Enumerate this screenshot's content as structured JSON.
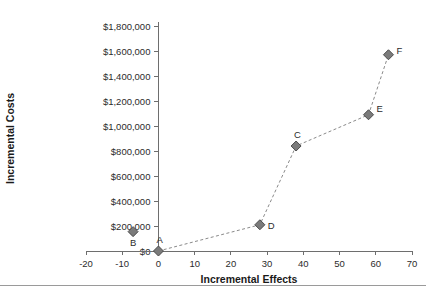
{
  "chart_data": {
    "type": "scatter",
    "title": "",
    "xlabel": "Incremental Effects",
    "ylabel": "Incremental Costs",
    "xlim": [
      -20,
      70
    ],
    "ylim": [
      0,
      1800000
    ],
    "grid": false,
    "legend": "none",
    "xticks": [
      "-20",
      "-10",
      "0",
      "10",
      "20",
      "30",
      "40",
      "50",
      "60",
      "70"
    ],
    "xtick_values": [
      -20,
      -10,
      0,
      10,
      20,
      30,
      40,
      50,
      60,
      70
    ],
    "yticks": [
      "$0",
      "$200,000",
      "$400,000",
      "$600,000",
      "$800,000",
      "$1,000,000",
      "$1,200,000",
      "$1,400,000",
      "$1,600,000",
      "$1,800,000"
    ],
    "ytick_values": [
      0,
      200000,
      400000,
      600000,
      800000,
      1000000,
      1200000,
      1400000,
      1600000,
      1800000
    ],
    "points": [
      {
        "label": "A",
        "x": 0,
        "y": 0,
        "label_dx": -2,
        "label_dy": -8
      },
      {
        "label": "B",
        "x": -7,
        "y": 155000,
        "label_dx": -3,
        "label_dy": 14
      },
      {
        "label": "C",
        "x": 38,
        "y": 840000,
        "label_dx": -2,
        "label_dy": -8
      },
      {
        "label": "D",
        "x": 28,
        "y": 210000,
        "label_dx": 8,
        "label_dy": 4
      },
      {
        "label": "E",
        "x": 58,
        "y": 1090000,
        "label_dx": 8,
        "label_dy": -3
      },
      {
        "label": "F",
        "x": 63.5,
        "y": 1570000,
        "label_dx": 8,
        "label_dy": -1
      }
    ],
    "frontier_path": [
      "A",
      "D",
      "C",
      "E",
      "F"
    ],
    "colors": {
      "marker_fill": "#7b7b7b",
      "marker_stroke": "#4c4c4c",
      "line": "#8a8a8a",
      "axis": "#6e6e6e",
      "text": "#2b2b2b",
      "background": "#ffffff"
    }
  }
}
